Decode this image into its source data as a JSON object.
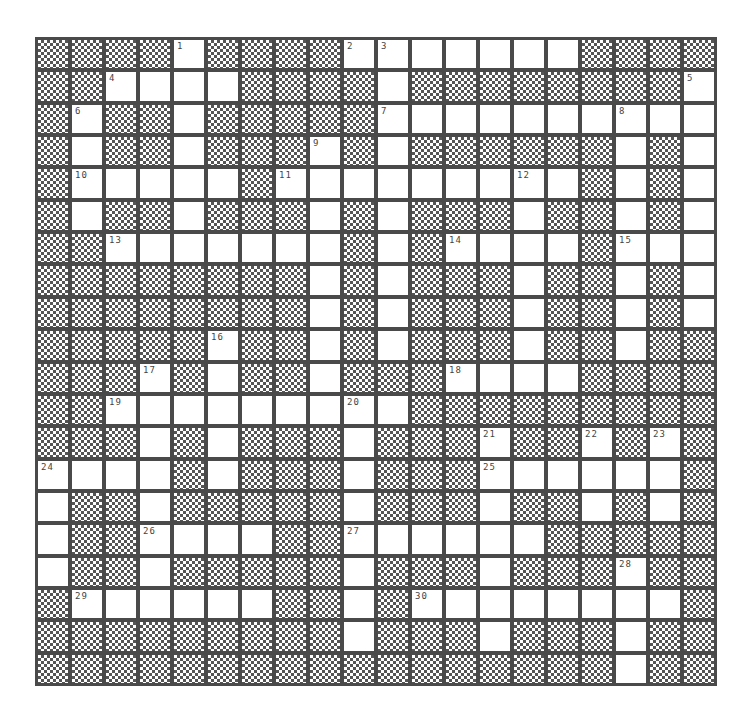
{
  "puzzle": {
    "rows": 20,
    "cols": 20,
    "legend": {
      "#": "blocked-cell",
      ".": "open-cell"
    },
    "grid": [
      "####.####.......###",
      "##....####.########.",
      "#.##.#####........",
      "#.##.###.#.######.#.",
      "#.....#.........#.#.",
      "#.##.###.#.###.##.#.",
      "##.......#.#....#...",
      "########.#.###.##.#.",
      "########.#.###.##.#.",
      "#####.##.#.###.##.##",
      "###.#.##.###....####",
      "##.........#########",
      "###.#.###.###.##.#.#",
      "....#.###.###......#",
      ".##.#####.###.##.#.#",
      ".##....##......#####",
      ".##.#####.###.###.##",
      "#......##.#........#",
      "#########.###.###.##",
      "#################.##"
    ],
    "grid_fixed": [
      "####.####.......####",
      "##....####.########.",
      "#.##.#####..........",
      "#.##.###.#.######.#.",
      "#.....#.........#.#.",
      "#.##.###.#.###.##.#.",
      "##.......#.#....#...",
      "########.#.###.##.#.",
      "########.#.###.##.#.",
      "#####.##.#.###.##.##",
      "###.#.##.###....####",
      "##.........#########",
      "###.#.###.###.##.#.#",
      "....#.###.###......#",
      ".##.#####.###.##.#.#",
      ".##....##......#####",
      ".##.#####.###.###.##",
      "#......##.#........#",
      "#########.###.###.##",
      "#################.##"
    ],
    "numbers": [
      {
        "row": 0,
        "col": 4,
        "label": "1"
      },
      {
        "row": 0,
        "col": 9,
        "label": "2"
      },
      {
        "row": 0,
        "col": 10,
        "label": "3"
      },
      {
        "row": 1,
        "col": 2,
        "label": "4"
      },
      {
        "row": 1,
        "col": 19,
        "label": "5"
      },
      {
        "row": 2,
        "col": 1,
        "label": "6"
      },
      {
        "row": 2,
        "col": 10,
        "label": "7"
      },
      {
        "row": 2,
        "col": 17,
        "label": "8"
      },
      {
        "row": 3,
        "col": 8,
        "label": "9"
      },
      {
        "row": 4,
        "col": 1,
        "label": "10"
      },
      {
        "row": 4,
        "col": 7,
        "label": "11"
      },
      {
        "row": 4,
        "col": 14,
        "label": "12"
      },
      {
        "row": 6,
        "col": 2,
        "label": "13"
      },
      {
        "row": 6,
        "col": 12,
        "label": "14"
      },
      {
        "row": 6,
        "col": 17,
        "label": "15"
      },
      {
        "row": 9,
        "col": 5,
        "label": "16"
      },
      {
        "row": 10,
        "col": 3,
        "label": "17"
      },
      {
        "row": 10,
        "col": 12,
        "label": "18"
      },
      {
        "row": 11,
        "col": 2,
        "label": "19"
      },
      {
        "row": 11,
        "col": 9,
        "label": "20"
      },
      {
        "row": 12,
        "col": 13,
        "label": "21"
      },
      {
        "row": 12,
        "col": 16,
        "label": "22"
      },
      {
        "row": 12,
        "col": 18,
        "label": "23"
      },
      {
        "row": 13,
        "col": 0,
        "label": "24"
      },
      {
        "row": 13,
        "col": 13,
        "label": "25"
      },
      {
        "row": 15,
        "col": 3,
        "label": "26"
      },
      {
        "row": 15,
        "col": 9,
        "label": "27"
      },
      {
        "row": 16,
        "col": 17,
        "label": "28"
      },
      {
        "row": 17,
        "col": 1,
        "label": "29"
      },
      {
        "row": 17,
        "col": 11,
        "label": "30"
      }
    ]
  }
}
